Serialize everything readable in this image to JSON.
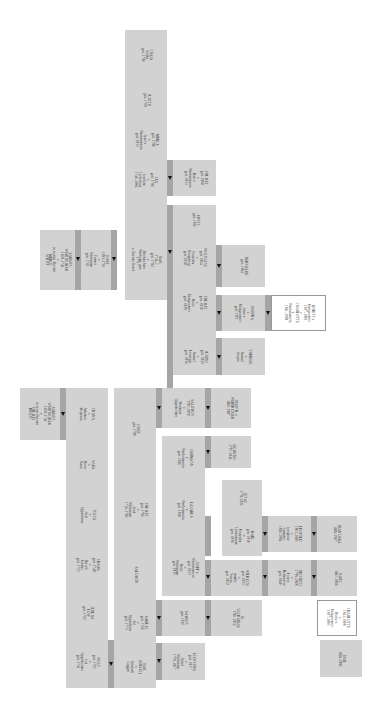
{
  "diagram": {
    "orientation": "rotated 90° clockwise",
    "colors": {
      "box": "#d2d2d2",
      "connector": "#a5a5a5",
      "arrow": "#111111",
      "highlight_box": "#ffffff"
    },
    "right_tree": {
      "root": "SAMSON\nWERTHEIMER\n1658–1724\n∞\nin zweiter Ehe mit\nMERLE\nSCHIFF",
      "gen2": "JOSEF\n1691–1761\n∞\nFrumet\nWertheimer\ngest. 1761",
      "gen3": "ISAK\n1724–?\ngest. 1782\n∞\nBeschka Sara\nWertheim, gest.\n1773\nz. Ehefrau David",
      "siblings": [
        {
          "text": "LEA\ngest. 1786\n∞\nJoachim\nLiebschutz\n1740–1804"
        },
        {
          "text": "MERLE\ngest. 1780\n∞\nJosef v.\nWertheimstein\ngest. 1813"
        },
        {
          "text": "JUDITH\ngest. 1769"
        },
        {
          "text": "CHAJA\nSARA\ngest. 1780"
        }
      ],
      "lea_child": "FRUMET\ngest. 1808\n∞\nKarl v.\nWertheimstein\ngest. 1813",
      "gen4": [
        {
          "text": "DAVID\n1765–1817\n∞\nBrunna\nWertheimer\ngest. 1807"
        },
        {
          "text": "FRUMET\ngest. 1810\n∞\nMoriz\nKönigswarter\ngest. 1829"
        },
        {
          "text": "WOLFGANG\ngest. 1804\n∞\nFranziska\nHönigsberg\ngest. 1818"
        },
        {
          "text": "ERNST\ngest. 1830"
        }
      ],
      "judith": "JUDITH\ngest. 1822\n∞\nSamuel\nLöwinger\ngest. 1836",
      "gen5": [
        {
          "text": "THERESE\n∞\nSamuel\nAsopos"
        },
        {
          "text": "JOSEPHA\n∞\nJonas v.\nKönigswarter\ngest. 1871"
        },
        {
          "text": "BERNHARD\ngest. 1864"
        }
      ],
      "gen6": {
        "text": "MORITZ v.\nKönigswarter\n1837–1893\n∞\nCHARLOTTE\nv.\nWertheimstein\n1841–1908"
      }
    },
    "left_tree": {
      "root": "SAMSON\nWERTHEIMER\n1658–1724\n∞\nin erster Ehe mit\nFRUMET\nBRILIN",
      "children": [
        {
          "text": "WOLF\ngest. 1765\n∞\nLea\nOppenheimer\ngest. 1741"
        },
        {
          "text": "JEHUDA\nLÖW\ngest. 1765"
        },
        {
          "text": "CHAWA\ngest. 1748\n∞\nBaruch\nEskeles\ngest. 1753"
        },
        {
          "text": "TOLZA\n∞\nJosef\nOppenheim"
        },
        {
          "text": "SARA\n∞\nMoses\nKann"
        },
        {
          "text": "CHANA\n∞\nSalomon\nMeiprann"
        }
      ],
      "wolf_children": [
        {
          "text": "ISAK\n(ISRAEL)\n∞\nScheindl\nGuggen"
        },
        {
          "text": "SAMUEL\ngest. 1766\n∞\nSel\nOppenheim\ngest. 1773"
        },
        {
          "text": "SALOMON"
        },
        {
          "text": "FRUMET\ngest. 1796\n∞\nJosef\nWertheimer\n1716–1783"
        },
        {
          "text": "JOSEF\ngest. 1789"
        }
      ],
      "gen3": [
        {
          "text": "ELEONORA\ngest. 1817\n∞\nDavid\nWertheimer\n1759–1817"
        },
        {
          "text": "SAMSON\ngest. 1810"
        },
        {
          "text": "JOSEF v.\nWertheimstein\ngest. 1813\n∞\nMerle\nWertheimer\ngest. 1815"
        },
        {
          "text": "LAZARUS\nv.\nWertheimstein\ngest. 1818"
        },
        {
          "text": "HERMANN\nv.\nWertheimstein\ngest. 1826"
        },
        {
          "text": "SALOMON\n1785–1859\n∞\nMarianne\nOppenheimer"
        }
      ],
      "gen4": [
        {
          "text": "Dr.\nZACHARIAS\n1780–1852"
        },
        {
          "text": "WILHELM\ngest. 1833\n∞\nAmalie\nNassau\ngest. 1852"
        },
        {
          "text": "KARL\ngest. 1810\n∞\nFranziska\nLindenbaum\ngest. 1836"
        },
        {
          "text": "IGNAZ\n1778–1822"
        },
        {
          "text": "SIGMUND\n1797–1824"
        },
        {
          "text": "JOSEF R. v.\nWERTHEIMER\n1800–1887"
        }
      ],
      "gen5": [
        {
          "text": "HEINRICH\n1799–1868\n∞\nLouise\nBodenstein\ngest. 1840"
        },
        {
          "text": "LEOPOLD\n1801–1883\n∞\nJosephine\nGomperz\n1820–1894"
        },
        {
          "text": "FRANZISKA\n1849–1907"
        }
      ],
      "gen6": [
        {
          "text": "EMIL\n1824–1882"
        },
        {
          "text": "CHARLOTTE\n1841–1908\n∞\nMoritz v.\nKönigswarter\n1837–1893",
          "highlight": true
        },
        {
          "text": "KARL\n1847–1866"
        }
      ]
    }
  }
}
